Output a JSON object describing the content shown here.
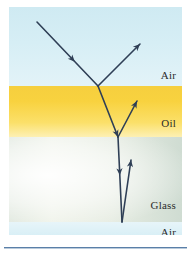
{
  "figure": {
    "plate": {
      "x": 9,
      "y": 7,
      "width": 173,
      "height": 228
    }
  },
  "media_layers": [
    {
      "id": "air-top",
      "label": "Air",
      "top": 0,
      "height": 79,
      "color_top": "#cfeaf2",
      "color_bottom": "#e3f3f8"
    },
    {
      "id": "oil",
      "label": "Oil",
      "top": 79,
      "height": 51,
      "color_top": "#f6cf3e",
      "color_bottom": "#fdf0b4"
    },
    {
      "id": "glass",
      "label": "Glass",
      "top": 130,
      "height": 85,
      "color_top": "#e6ece2",
      "color_bottom": "#cfdcd2"
    },
    {
      "id": "air-bottom",
      "label": "Air",
      "top": 215,
      "height": 13,
      "color_top": "#e7f5f9",
      "color_bottom": "#d9eff6"
    }
  ],
  "labels": {
    "air_top": "Air",
    "oil": "Oil",
    "glass": "Glass",
    "air_bottom": "Air"
  },
  "rays": {
    "stroke_color": "#2f3f56",
    "stroke_width": 1.6,
    "segments": [
      {
        "name": "incident-ray",
        "medium": "air",
        "x1": 28,
        "y1": 15,
        "x2": 89,
        "y2": 79,
        "arrow_at": 0.62
      },
      {
        "name": "reflected-ray-air",
        "medium": "air",
        "x1": 89,
        "y1": 79,
        "x2": 131,
        "y2": 37,
        "arrow_at": 1.0
      },
      {
        "name": "refracted-ray-oil",
        "medium": "oil",
        "x1": 89,
        "y1": 79,
        "x2": 109,
        "y2": 130,
        "arrow_at": 1.0
      },
      {
        "name": "reflected-ray-oil",
        "medium": "oil",
        "x1": 109,
        "y1": 130,
        "x2": 128,
        "y2": 94,
        "arrow_at": 1.0
      },
      {
        "name": "refracted-ray-glass",
        "medium": "glass",
        "x1": 109,
        "y1": 130,
        "x2": 113,
        "y2": 215,
        "arrow_at": 0.45
      },
      {
        "name": "reflected-ray-glass",
        "medium": "glass",
        "x1": 113,
        "y1": 215,
        "x2": 122,
        "y2": 153,
        "arrow_at": 1.0
      }
    ]
  },
  "bottom_rule": {
    "color": "#5a7fa8",
    "shadow_color": "#b9cadb"
  }
}
